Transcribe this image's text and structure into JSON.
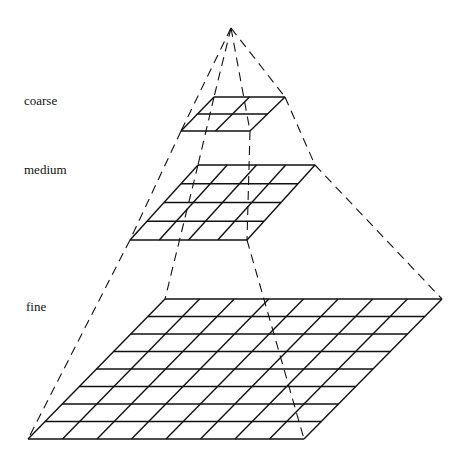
{
  "diagram": {
    "type": "multigrid-pyramid",
    "apex": [
      231,
      28
    ],
    "levels": [
      {
        "name": "coarse",
        "label": "coarse",
        "label_pos": [
          24,
          93
        ],
        "cells": 2,
        "top": {
          "y": 97,
          "x0": 214,
          "x1": 285
        },
        "bottom": {
          "y": 131,
          "x0": 181,
          "x1": 250
        }
      },
      {
        "name": "medium",
        "label": "medium",
        "label_pos": [
          24,
          162
        ],
        "cells": 4,
        "top": {
          "y": 165,
          "x0": 198,
          "x1": 315
        },
        "bottom": {
          "y": 240,
          "x0": 130,
          "x1": 247
        }
      },
      {
        "name": "fine",
        "label": "fine",
        "label_pos": [
          26,
          299
        ],
        "cells": 8,
        "top": {
          "y": 299,
          "x0": 165,
          "x1": 442
        },
        "bottom": {
          "y": 439,
          "x0": 28,
          "x1": 304
        }
      }
    ],
    "edges_from_apex": [
      "fine.bottom-left",
      "fine.top-left",
      "fine.bottom-right",
      "fine.top-right"
    ]
  }
}
